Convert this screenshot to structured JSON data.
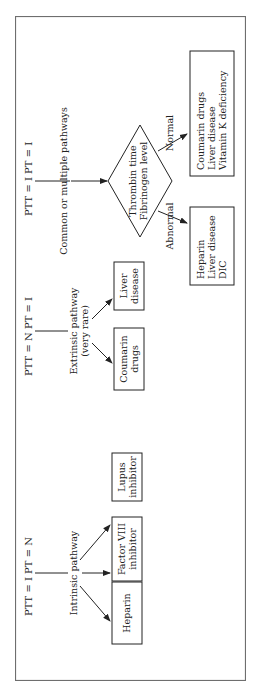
{
  "diagram": {
    "type": "flowchart",
    "orientation": "rotated-90-ccw",
    "columns": [
      {
        "header": "PTT = I   PT = N",
        "pathway": "Intrinsic pathway",
        "pathway_sub": "",
        "outcomes": [
          {
            "lines": [
              "Heparin"
            ]
          },
          {
            "lines": [
              "Factor VIII",
              "inhibitor"
            ]
          },
          {
            "lines": [
              "Lupus",
              "inhibitor"
            ]
          }
        ]
      },
      {
        "header": "PTT = N   PT = I",
        "pathway": "Extrinsic pathway",
        "pathway_sub": "(very rare)",
        "outcomes": [
          {
            "lines": [
              "Coumarin",
              "drugs"
            ]
          },
          {
            "lines": [
              "Liver",
              "disease"
            ]
          }
        ]
      },
      {
        "header": "PTT = I   PT = I",
        "pathway": "Common or multiple pathways",
        "decision": {
          "lines": [
            "Thrombin time",
            "Fibrinogen level"
          ]
        },
        "branches": [
          {
            "label": "Abnormal",
            "lines": [
              "Heparin",
              "Liver disease",
              "DIC"
            ]
          },
          {
            "label": "Normal",
            "lines": [
              "Coumarin drugs",
              "Liver disease",
              "Vitamin K deficiency"
            ]
          }
        ]
      }
    ]
  }
}
